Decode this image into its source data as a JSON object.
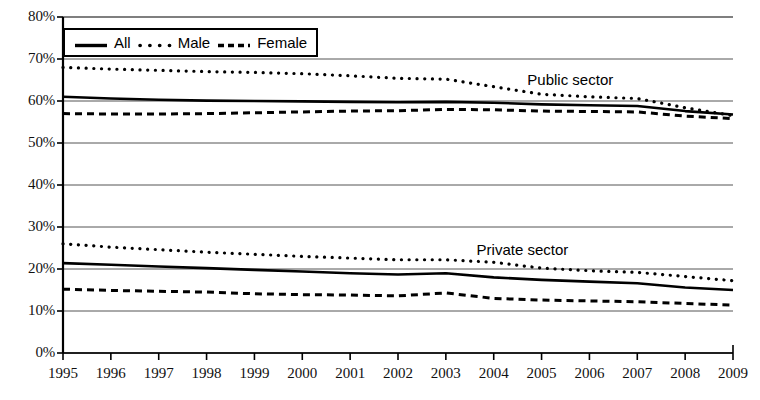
{
  "chart_data": {
    "type": "line",
    "title": "",
    "subtitle": "",
    "xlabel": "",
    "ylabel": "",
    "x": [
      1995,
      1996,
      1997,
      1998,
      1999,
      2000,
      2001,
      2002,
      2003,
      2004,
      2005,
      2006,
      2007,
      2008,
      2009
    ],
    "categories": [
      "1995",
      "1996",
      "1997",
      "1998",
      "1999",
      "2000",
      "2001",
      "2002",
      "2003",
      "2004",
      "2005",
      "2006",
      "2007",
      "2008",
      "2009"
    ],
    "ylim": [
      0,
      80
    ],
    "xlim": [
      1995,
      2009
    ],
    "ytick_values": [
      0,
      10,
      20,
      30,
      40,
      50,
      60,
      70,
      80
    ],
    "ytick_labels": [
      "0%",
      "10%",
      "20%",
      "30%",
      "40%",
      "50%",
      "60%",
      "70%",
      "80%"
    ],
    "grid": "horizontal",
    "legend_position": "top-left-inside",
    "legend": [
      "All",
      "Male",
      "Female"
    ],
    "annotations": [
      {
        "text": "Public sector",
        "x": 2005.6,
        "y": 65.0
      },
      {
        "text": "Private sector",
        "x": 2004.6,
        "y": 24.5
      }
    ],
    "groups": [
      {
        "name": "Public sector",
        "series": [
          {
            "name": "All",
            "style": "solid",
            "values": [
              61.0,
              60.6,
              60.3,
              60.1,
              60.0,
              59.9,
              59.8,
              59.7,
              59.8,
              59.6,
              59.2,
              59.0,
              58.8,
              57.6,
              56.8
            ]
          },
          {
            "name": "Male",
            "style": "dotted",
            "values": [
              68.0,
              67.6,
              67.3,
              67.0,
              66.8,
              66.5,
              66.0,
              65.4,
              65.2,
              63.4,
              61.6,
              61.0,
              60.6,
              58.4,
              56.5
            ]
          },
          {
            "name": "Female",
            "style": "dashed",
            "values": [
              57.0,
              56.9,
              56.9,
              57.0,
              57.2,
              57.4,
              57.6,
              57.7,
              58.0,
              57.9,
              57.6,
              57.5,
              57.4,
              56.4,
              55.8
            ]
          }
        ]
      },
      {
        "name": "Private sector",
        "series": [
          {
            "name": "All",
            "style": "solid",
            "values": [
              21.4,
              21.0,
              20.6,
              20.2,
              19.8,
              19.4,
              19.0,
              18.7,
              19.0,
              18.0,
              17.4,
              17.0,
              16.6,
              15.6,
              15.0
            ]
          },
          {
            "name": "Male",
            "style": "dotted",
            "values": [
              26.0,
              25.2,
              24.6,
              24.0,
              23.5,
              23.0,
              22.6,
              22.2,
              22.2,
              21.6,
              20.2,
              19.6,
              19.2,
              18.2,
              17.2
            ]
          },
          {
            "name": "Female",
            "style": "dashed",
            "values": [
              15.2,
              14.9,
              14.7,
              14.5,
              14.1,
              13.9,
              13.8,
              13.6,
              14.3,
              13.0,
              12.6,
              12.4,
              12.2,
              11.8,
              11.4
            ]
          }
        ]
      }
    ]
  },
  "legend": {
    "items": [
      {
        "label": "All",
        "icon": "solid-line-swatch"
      },
      {
        "label": "Male",
        "icon": "dotted-line-swatch"
      },
      {
        "label": "Female",
        "icon": "dashed-line-swatch"
      }
    ]
  },
  "annotations": {
    "public": "Public sector",
    "private": "Private sector"
  },
  "axes": {
    "y_labels": [
      "80%",
      "70%",
      "60%",
      "50%",
      "40%",
      "30%",
      "20%",
      "10%",
      "0%"
    ],
    "x_labels": [
      "1995",
      "1996",
      "1997",
      "1998",
      "1999",
      "2000",
      "2001",
      "2002",
      "2003",
      "2004",
      "2005",
      "2006",
      "2007",
      "2008",
      "2009"
    ]
  }
}
